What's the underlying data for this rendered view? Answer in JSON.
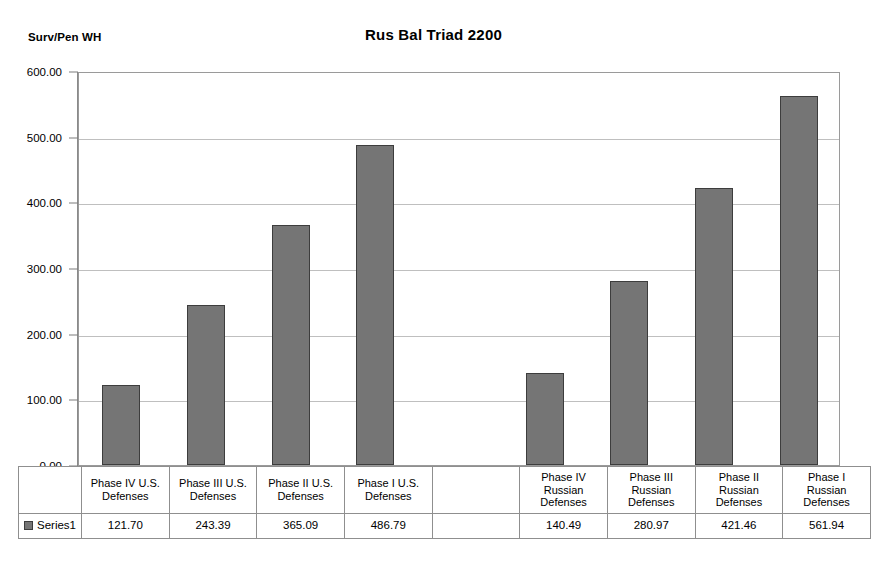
{
  "chart_data": {
    "type": "bar",
    "title": "Rus Bal Triad 2200",
    "ylabel": "Surv/Pen WH",
    "xlabel": "",
    "ylim": [
      0,
      600
    ],
    "ytick_step": 100,
    "grid": true,
    "legend": "Series1",
    "legend_position": "data-table-left",
    "value_format": "2 decimals",
    "categories": [
      "Phase IV U.S. Defenses",
      "Phase III U.S. Defenses",
      "Phase II U.S. Defenses",
      "Phase I U.S. Defenses",
      "",
      "Phase IV Russian Defenses",
      "Phase III Russian Defenses",
      "Phase II Russian Defenses",
      "Phase I Russian Defenses"
    ],
    "category_lines": [
      [
        "Phase IV U.S.",
        "Defenses"
      ],
      [
        "Phase III U.S.",
        "Defenses"
      ],
      [
        "Phase II U.S.",
        "Defenses"
      ],
      [
        "Phase I U.S.",
        "Defenses"
      ],
      [
        ""
      ],
      [
        "Phase IV",
        "Russian",
        "Defenses"
      ],
      [
        "Phase III",
        "Russian",
        "Defenses"
      ],
      [
        "Phase II",
        "Russian",
        "Defenses"
      ],
      [
        "Phase I",
        "Russian",
        "Defenses"
      ]
    ],
    "series": [
      {
        "name": "Series1",
        "values": [
          121.7,
          243.39,
          365.09,
          486.79,
          null,
          140.49,
          280.97,
          421.46,
          561.94
        ],
        "labels": [
          "121.70",
          "243.39",
          "365.09",
          "486.79",
          "",
          "140.49",
          "280.97",
          "421.46",
          "561.94"
        ],
        "color": "#757575",
        "border_color": "#3d3d3d"
      }
    ],
    "ytick_labels": [
      "600.00",
      "500.00",
      "400.00",
      "300.00",
      "200.00",
      "100.00",
      "0.00"
    ],
    "ytick_values": [
      600,
      500,
      400,
      300,
      200,
      100,
      0
    ]
  },
  "table": {
    "legend_label": "Series1"
  },
  "colors": {
    "bar_fill": "#757575",
    "bar_border": "#3d3d3d",
    "gridline": "#bfbfbf",
    "frame": "#9a9a9a",
    "table_border": "#8f8f8f",
    "background": "#ffffff",
    "text": "#000000"
  }
}
